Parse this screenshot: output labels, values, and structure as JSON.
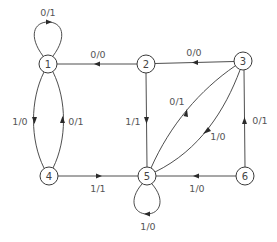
{
  "diagram": {
    "type": "finite-state-machine",
    "nodes": [
      {
        "id": "1",
        "label": "1",
        "x": 48,
        "y": 64
      },
      {
        "id": "2",
        "label": "2",
        "x": 146,
        "y": 64
      },
      {
        "id": "3",
        "label": "3",
        "x": 243,
        "y": 61
      },
      {
        "id": "4",
        "label": "4",
        "x": 49,
        "y": 176
      },
      {
        "id": "5",
        "label": "5",
        "x": 147,
        "y": 176
      },
      {
        "id": "6",
        "label": "6",
        "x": 245,
        "y": 176
      }
    ],
    "edges": [
      {
        "from": "1",
        "to": "1",
        "label": "0/1",
        "kind": "self-loop-top"
      },
      {
        "from": "2",
        "to": "1",
        "label": "0/0"
      },
      {
        "from": "3",
        "to": "2",
        "label": "0/0"
      },
      {
        "from": "1",
        "to": "4",
        "label": "1/0"
      },
      {
        "from": "4",
        "to": "1",
        "label": "0/1"
      },
      {
        "from": "2",
        "to": "5",
        "label": "1/1"
      },
      {
        "from": "5",
        "to": "3",
        "label": "0/1"
      },
      {
        "from": "3",
        "to": "5",
        "label": "1/0"
      },
      {
        "from": "6",
        "to": "3",
        "label": "0/1"
      },
      {
        "from": "4",
        "to": "5",
        "label": "1/1"
      },
      {
        "from": "6",
        "to": "5",
        "label": "1/0"
      },
      {
        "from": "5",
        "to": "5",
        "label": "1/0",
        "kind": "self-loop-bottom"
      }
    ],
    "colors": {
      "stroke": "#3a3a3a",
      "text": "#444444",
      "background": "#ffffff"
    }
  }
}
